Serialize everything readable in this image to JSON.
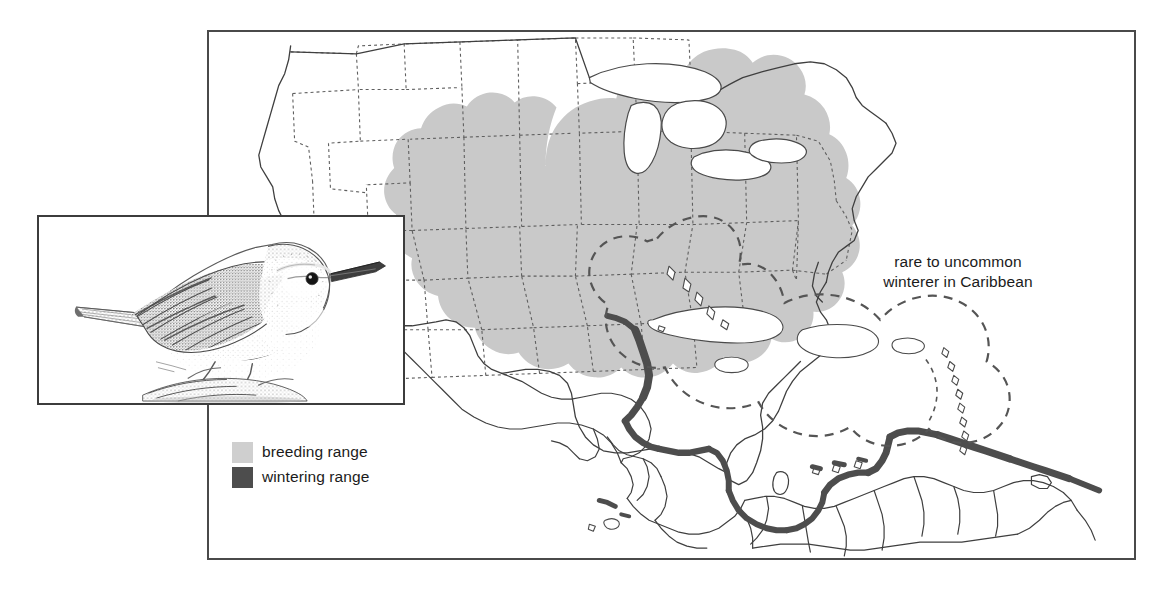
{
  "figure": {
    "type": "range-map",
    "background_color": "#ffffff"
  },
  "map": {
    "frame": {
      "border_color": "#4a4a4a",
      "background": "#ffffff"
    },
    "annotation": {
      "caribbean_note": "rare to uncommon\nwinterer in Caribbean"
    },
    "regions": [
      {
        "id": "breeding",
        "label": "breeding range",
        "color": "#c8c8c8",
        "description": "eastern United States from eastern Great Plains to Atlantic coast, south to Gulf Coast and Florida peninsula, north to Great Lakes"
      },
      {
        "id": "wintering",
        "label": "wintering range",
        "color": "#4a4a4a",
        "description": "coastal band from Yucatan and Caribbean coast of Central America through Panama to northern South America"
      },
      {
        "id": "caribbean-occasional",
        "label": "rare to uncommon winterer in Caribbean",
        "color": "#555555",
        "line_style": "dashed",
        "description": "dashed enclosure around Bahamas, Greater Antilles and Lesser Antilles"
      }
    ],
    "boundaries": {
      "state_line_style": "dashed",
      "country_line_style": "solid",
      "line_color": "#5a5a5a"
    }
  },
  "legend": {
    "items": [
      {
        "label": "breeding range",
        "color": "#cfcfcf"
      },
      {
        "label": "wintering range",
        "color": "#4d4d4d"
      }
    ]
  },
  "inset": {
    "name": "bird-illustration",
    "description": "pen-and-ink stipple illustration of a perched warbler facing right",
    "border_color": "#3c3c3c"
  }
}
